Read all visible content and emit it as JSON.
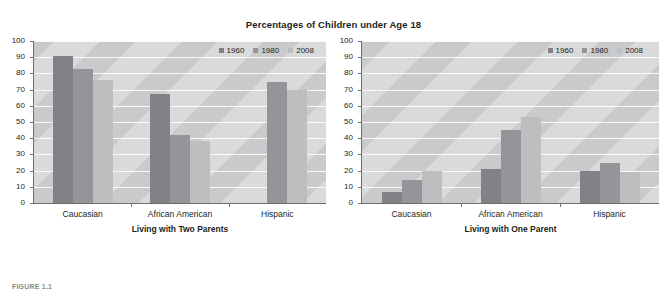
{
  "figure": {
    "title": "Percentages of Children under Age 18",
    "caption": "FIGURE 1.1"
  },
  "legend": {
    "entries": [
      {
        "label": "1960",
        "color": "#808285"
      },
      {
        "label": "1980",
        "color": "#939598"
      },
      {
        "label": "2008",
        "color": "#bcbec0"
      }
    ]
  },
  "yaxis": {
    "ticks": [
      "100",
      "90",
      "80",
      "70",
      "60",
      "50",
      "40",
      "30",
      "20",
      "10",
      "0"
    ]
  },
  "chart_data": [
    {
      "type": "bar",
      "title": "Percentages of Children under Age 18",
      "xlabel": "Living with Two Parents",
      "ylabel": "",
      "ylim": [
        0,
        100
      ],
      "ytick_step": 10,
      "grid": true,
      "legend_position": "top-right",
      "categories": [
        "Caucasian",
        "African American",
        "Hispanic"
      ],
      "series": [
        {
          "name": "1960",
          "color": "#808285",
          "values": [
            91,
            67,
            null
          ]
        },
        {
          "name": "1980",
          "color": "#939598",
          "values": [
            83,
            42,
            75
          ]
        },
        {
          "name": "2008",
          "color": "#bcbec0",
          "values": [
            76,
            38,
            70
          ]
        }
      ]
    },
    {
      "type": "bar",
      "title": "Percentages of Children under Age 18",
      "xlabel": "Living with One Parent",
      "ylabel": "",
      "ylim": [
        0,
        100
      ],
      "ytick_step": 10,
      "grid": true,
      "legend_position": "top-right",
      "categories": [
        "Caucasian",
        "African American",
        "Hispanic"
      ],
      "series": [
        {
          "name": "1960",
          "color": "#808285",
          "values": [
            7,
            21,
            20
          ]
        },
        {
          "name": "1980",
          "color": "#939598",
          "values": [
            14,
            45,
            25
          ]
        },
        {
          "name": "2008",
          "color": "#bcbec0",
          "values": [
            20,
            53,
            19
          ]
        }
      ]
    }
  ]
}
